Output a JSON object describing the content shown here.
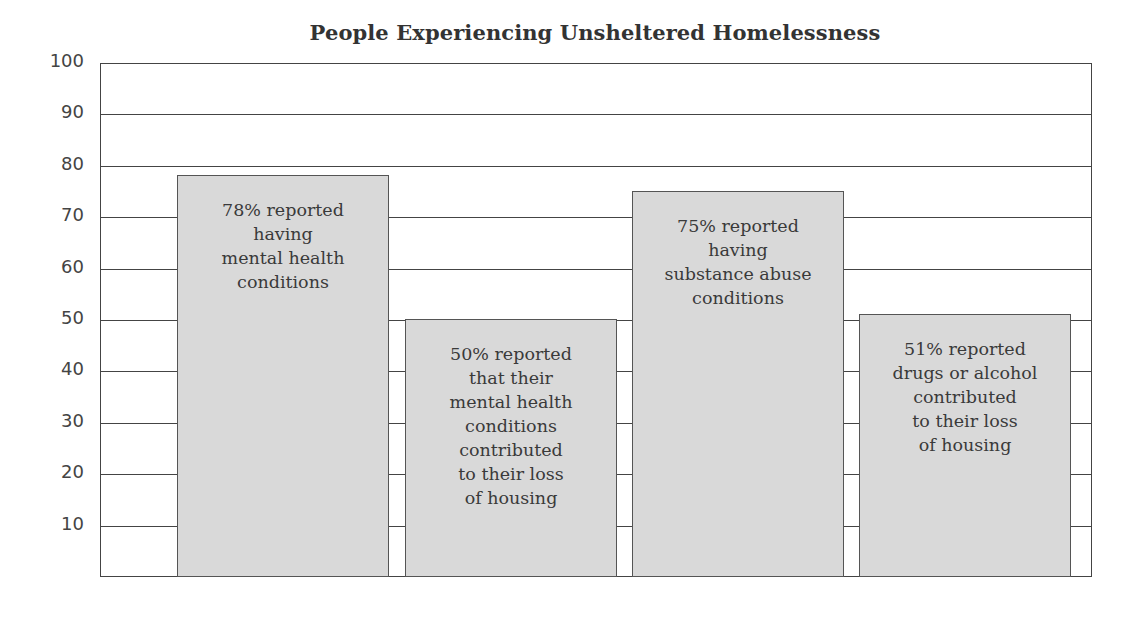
{
  "chart_data": {
    "type": "bar",
    "title": "People Experiencing Unsheltered Homelessness",
    "xlabel": "",
    "ylabel": "",
    "ylim": [
      0,
      100
    ],
    "yticks": [
      10,
      20,
      30,
      40,
      50,
      60,
      70,
      80,
      90,
      100
    ],
    "grid": true,
    "legend": null,
    "categories": [
      "Reported having mental health conditions",
      "Mental health conditions contributed to loss of housing",
      "Reported having substance abuse conditions",
      "Drugs or alcohol contributed to loss of housing"
    ],
    "values": [
      78,
      50,
      75,
      51
    ],
    "bar_labels": [
      "78% reported\nhaving\nmental health\nconditions",
      "50% reported\nthat their\nmental health\nconditions\ncontributed\nto their loss\nof housing",
      "75% reported\nhaving\nsubstance abuse\nconditions",
      "51% reported\ndrugs or alcohol\ncontributed\nto their loss\nof housing"
    ],
    "colors": {
      "bar_fill": "#d9d9d9",
      "bar_border": "#555555",
      "grid": "#444444"
    }
  }
}
